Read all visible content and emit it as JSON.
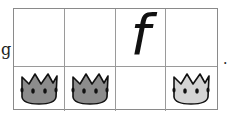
{
  "prefix_letter": "g",
  "suffix": ".",
  "grid": {
    "rows": 2,
    "cols": 4,
    "top_row": [
      {
        "content": ""
      },
      {
        "content": ""
      },
      {
        "content": "f"
      },
      {
        "content": ""
      }
    ],
    "bottom_row": [
      {
        "content": "crown",
        "shade": "dark",
        "fill": "#8c8c8c"
      },
      {
        "content": "crown",
        "shade": "dark",
        "fill": "#8c8c8c"
      },
      {
        "content": ""
      },
      {
        "content": "crown",
        "shade": "light",
        "fill": "#d4d4d4"
      }
    ]
  },
  "colors": {
    "border": "#9a9a9a",
    "crown_outline": "#111111"
  }
}
